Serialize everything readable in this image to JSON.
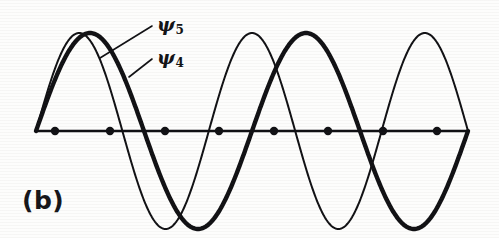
{
  "figure": {
    "panel_label": "(b)",
    "background_color": "#fdfdfc",
    "ink_color": "#111114",
    "width": 499,
    "height": 238
  },
  "labels": {
    "psi5": {
      "symbol": "ψ",
      "subscript": "5"
    },
    "psi4": {
      "symbol": "ψ",
      "subscript": "4"
    }
  },
  "chart_data": {
    "type": "line",
    "title": "(b)",
    "xlabel": "",
    "ylabel": "",
    "grid": false,
    "legend_position": "inline-annotation",
    "axis": {
      "baseline_y": 131,
      "x_start": 36,
      "x_end": 468,
      "stroke_width": 2.4
    },
    "atom_markers": {
      "count": 8,
      "radius": 4.2,
      "x": [
        55,
        110,
        165,
        219,
        274,
        328,
        383,
        437
      ],
      "y": 131
    },
    "series": [
      {
        "name": "ψ5",
        "label": "psi5",
        "half_waves": 5,
        "nodes": 4,
        "stroke_width": 2.0,
        "style": "thin",
        "amplitude": 98,
        "x_range": [
          36,
          468
        ],
        "node_x": [
          122,
          208,
          295,
          381
        ],
        "extrema": [
          {
            "x": 79,
            "y": 33,
            "sign": "+"
          },
          {
            "x": 165,
            "y": 229,
            "sign": "-"
          },
          {
            "x": 252,
            "y": 33,
            "sign": "+"
          },
          {
            "x": 338,
            "y": 229,
            "sign": "-"
          },
          {
            "x": 425,
            "y": 33,
            "sign": "+"
          }
        ]
      },
      {
        "name": "ψ4",
        "label": "psi4",
        "half_waves": 4,
        "nodes": 3,
        "stroke_width": 4.4,
        "style": "thick",
        "amplitude": 98,
        "x_range": [
          36,
          468
        ],
        "node_x": [
          144,
          252,
          360
        ],
        "extrema": [
          {
            "x": 90,
            "y": 33,
            "sign": "+"
          },
          {
            "x": 198,
            "y": 229,
            "sign": "-"
          },
          {
            "x": 306,
            "y": 33,
            "sign": "+"
          },
          {
            "x": 414,
            "y": 229,
            "sign": "-"
          }
        ]
      }
    ],
    "annotations": [
      {
        "text": "ψ5",
        "label_x": 157,
        "label_y": 24,
        "leader_from": [
          100,
          58
        ],
        "leader_to": [
          152,
          26
        ]
      },
      {
        "text": "ψ4",
        "label_x": 157,
        "label_y": 57,
        "leader_from": [
          129,
          77
        ],
        "leader_to": [
          152,
          59
        ]
      }
    ]
  }
}
